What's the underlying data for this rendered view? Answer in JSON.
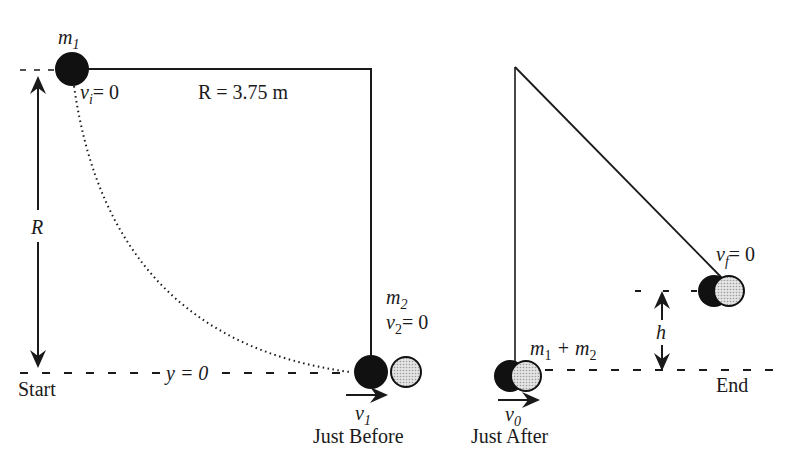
{
  "diagram": {
    "type": "ballistic pendulum collision",
    "colors": {
      "ink": "#1a1a1a",
      "mass1": "#111111",
      "mass2": "#cfcfcf"
    },
    "left_panel": {
      "mass1_label": "m",
      "mass1_sub": "1",
      "vi_label": "v",
      "vi_sub": "i",
      "vi_value": "= 0",
      "radius_label": "R = 3.75 m",
      "radius_axis_label": "R",
      "mass2_label": "m",
      "mass2_sub": "2",
      "v2_label": "v",
      "v2_sub": "2",
      "v2_value": "= 0",
      "y0_label": "y = 0",
      "start_label": "Start",
      "v1_label": "v",
      "v1_sub": "1",
      "caption": "Just Before"
    },
    "right_panel": {
      "combined_label_a": "m",
      "combined_sub_a": "1",
      "combined_plus": " + m",
      "combined_sub_b": "2",
      "vf_label": "v",
      "vf_sub": "f",
      "vf_value": "= 0",
      "h_label": "h",
      "end_label": "End",
      "v0_label": "v",
      "v0_sub": "0",
      "caption": "Just After"
    }
  }
}
